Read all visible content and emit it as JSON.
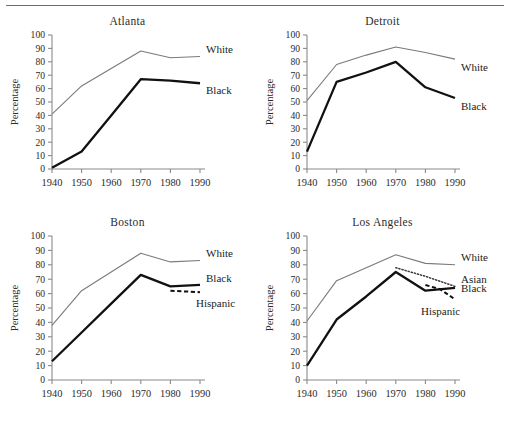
{
  "figure": {
    "ylabel": "Percentage",
    "xticks": [
      "1940",
      "1950",
      "1960",
      "1970",
      "1980",
      "1990"
    ],
    "yticks": [
      "0",
      "10",
      "20",
      "30",
      "40",
      "50",
      "60",
      "70",
      "80",
      "90",
      "100"
    ]
  },
  "chart_data": {
    "type": "line",
    "title": "",
    "xlabel": "",
    "ylabel": "Percentage",
    "xlim": [
      1940,
      1990
    ],
    "ylim": [
      0,
      100
    ],
    "grid": false,
    "legend_position": "inline-right-of-line-ends",
    "x": [
      1940,
      1950,
      1960,
      1970,
      1980,
      1990
    ],
    "panels": [
      {
        "title": "Atlanta",
        "series": [
          {
            "name": "White",
            "style": "thin-solid",
            "x": [
              1940,
              1950,
              1960,
              1970,
              1980,
              1990
            ],
            "values": [
              41,
              62,
              75,
              88,
              83,
              84
            ]
          },
          {
            "name": "Black",
            "style": "thick-solid",
            "x": [
              1940,
              1950,
              1960,
              1970,
              1980,
              1990
            ],
            "values": [
              1,
              13,
              40,
              67,
              66,
              64
            ]
          }
        ]
      },
      {
        "title": "Detroit",
        "series": [
          {
            "name": "White",
            "style": "thin-solid",
            "x": [
              1940,
              1950,
              1960,
              1970,
              1980,
              1990
            ],
            "values": [
              51,
              78,
              85,
              91,
              87,
              82
            ]
          },
          {
            "name": "Black",
            "style": "thick-solid",
            "x": [
              1940,
              1950,
              1960,
              1970,
              1980,
              1990
            ],
            "values": [
              13,
              65,
              72,
              80,
              61,
              53
            ]
          }
        ]
      },
      {
        "title": "Boston",
        "series": [
          {
            "name": "White",
            "style": "thin-solid",
            "x": [
              1940,
              1950,
              1960,
              1970,
              1980,
              1990
            ],
            "values": [
              38,
              62,
              75,
              88,
              82,
              83
            ]
          },
          {
            "name": "Black",
            "style": "thick-solid",
            "x": [
              1940,
              1950,
              1960,
              1970,
              1980,
              1990
            ],
            "values": [
              13,
              33,
              53,
              73,
              65,
              66
            ]
          },
          {
            "name": "Hispanic",
            "style": "dashed",
            "x": [
              1980,
              1990
            ],
            "values": [
              62,
              61
            ]
          }
        ]
      },
      {
        "title": "Los Angeles",
        "series": [
          {
            "name": "White",
            "style": "thin-solid",
            "x": [
              1940,
              1950,
              1960,
              1970,
              1980,
              1990
            ],
            "values": [
              41,
              69,
              78,
              87,
              81,
              80
            ]
          },
          {
            "name": "Black",
            "style": "thick-solid",
            "x": [
              1940,
              1950,
              1960,
              1970,
              1980,
              1990
            ],
            "values": [
              10,
              42,
              58,
              75,
              62,
              64
            ]
          },
          {
            "name": "Asian",
            "style": "dotted",
            "x": [
              1970,
              1980,
              1990
            ],
            "values": [
              78,
              72,
              65
            ]
          },
          {
            "name": "Hispanic",
            "style": "dashed",
            "x": [
              1980,
              1985,
              1990
            ],
            "values": [
              66,
              63,
              56
            ]
          }
        ]
      }
    ]
  }
}
